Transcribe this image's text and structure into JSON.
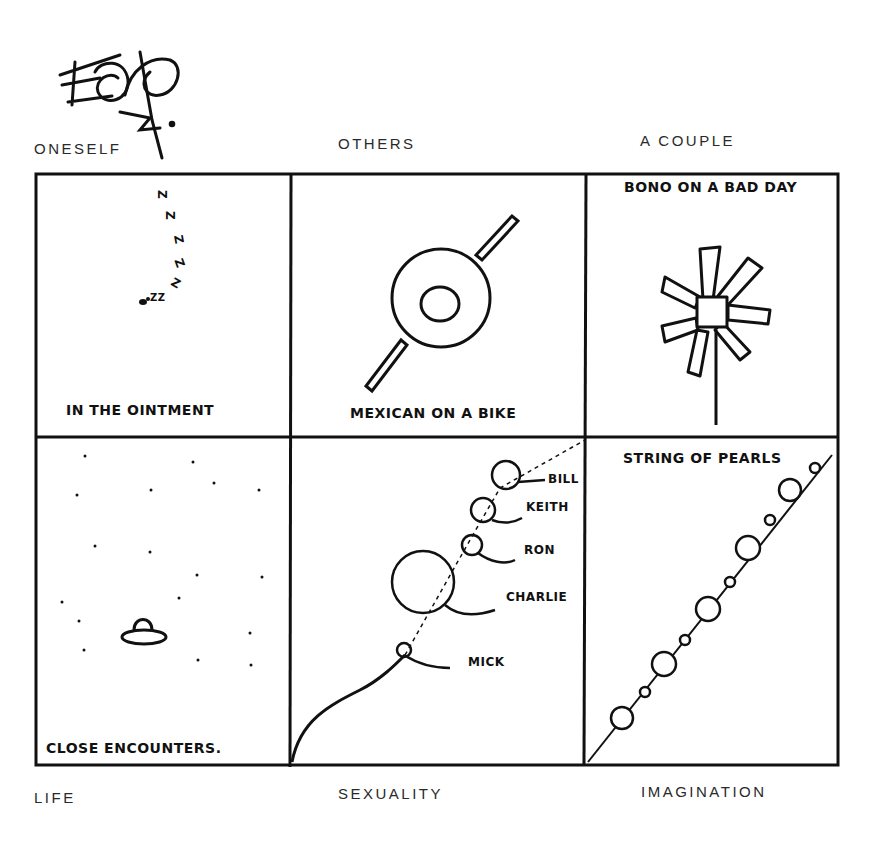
{
  "signature": {
    "text": "Eddy"
  },
  "top_labels": {
    "oneself": "ONESELF",
    "others": "OTHERS",
    "a_couple": "A COUPLE"
  },
  "bottom_labels": {
    "life": "LIFE",
    "sexuality": "SEXUALITY",
    "imagination": "IMAGINATION"
  },
  "panels": [
    {
      "id": "fly",
      "caption": "IN THE OINTMENT",
      "zzz": [
        "Z",
        "Z",
        "Z",
        "Z",
        "Z",
        "ZZ"
      ]
    },
    {
      "id": "mexican",
      "caption": "MEXICAN ON A BIKE"
    },
    {
      "id": "bono",
      "caption": "BONO ON A BAD DAY"
    },
    {
      "id": "ufo",
      "caption": "CLOSE ENCOUNTERS."
    },
    {
      "id": "stones",
      "caption": "",
      "names": [
        "BILL",
        "KEITH",
        "RON",
        "CHARLIE",
        "MICK"
      ]
    },
    {
      "id": "pearls",
      "caption": "STRING OF PEARLS"
    }
  ],
  "colors": {
    "ink": "#111111",
    "label": "#2a2a2a",
    "paper": "#ffffff"
  }
}
